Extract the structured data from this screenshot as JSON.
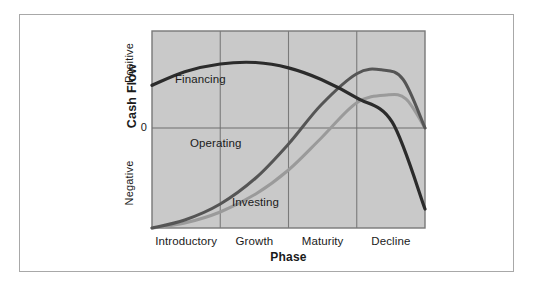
{
  "figure": {
    "border_color": "#a8a8a8",
    "background": "#ffffff"
  },
  "chart_data": {
    "type": "line",
    "title": "",
    "xlabel": "Phase",
    "ylabel": "Cash Flow",
    "categories": [
      "Introductory",
      "Growth",
      "Maturity",
      "Decline"
    ],
    "y_tick_labels": [
      "Positive",
      "0",
      "Negative"
    ],
    "ylim": [
      -1.0,
      1.0
    ],
    "grid": "vertical category dividers plus zero baseline",
    "legend": "inline labels on curves",
    "plot_background": "#c9c9c9",
    "plot_border_color": "#787878",
    "gridline_color": "#7a7a7a",
    "zero_line_color": "#6e6e6e",
    "series": [
      {
        "name": "Financing",
        "color": "#2b2b2b",
        "width": 3.2,
        "description": "Starts positive in Introductory, peaks early in Growth, declines steadily through Maturity and ends deeply negative in Decline.",
        "points": [
          [
            0.0,
            0.44
          ],
          [
            0.12,
            0.58
          ],
          [
            0.25,
            0.66
          ],
          [
            0.38,
            0.675
          ],
          [
            0.5,
            0.62
          ],
          [
            0.62,
            0.5
          ],
          [
            0.75,
            0.31
          ],
          [
            0.88,
            0.06
          ],
          [
            1.0,
            -0.81
          ]
        ]
      },
      {
        "name": "Operating",
        "color": "#555555",
        "width": 3.0,
        "description": "Starts deeply negative at launch, rises through Growth, crosses zero entering Maturity, peaks in Maturity then falls back to zero by end of Decline.",
        "points": [
          [
            0.0,
            -1.0
          ],
          [
            0.12,
            -0.92
          ],
          [
            0.25,
            -0.76
          ],
          [
            0.38,
            -0.5
          ],
          [
            0.5,
            -0.16
          ],
          [
            0.62,
            0.24
          ],
          [
            0.75,
            0.56
          ],
          [
            0.84,
            0.6
          ],
          [
            0.92,
            0.5
          ],
          [
            1.0,
            0.0
          ]
        ]
      },
      {
        "name": "Investing",
        "color": "#9a9a9a",
        "width": 3.0,
        "description": "Starts deeply negative, rises more slowly than Operating, crosses zero mid Maturity, peaks lower in Decline then returns to zero.",
        "points": [
          [
            0.0,
            -1.0
          ],
          [
            0.12,
            -0.95
          ],
          [
            0.25,
            -0.84
          ],
          [
            0.38,
            -0.66
          ],
          [
            0.5,
            -0.42
          ],
          [
            0.62,
            -0.1
          ],
          [
            0.75,
            0.26
          ],
          [
            0.86,
            0.34
          ],
          [
            0.93,
            0.3
          ],
          [
            1.0,
            0.0
          ]
        ]
      }
    ]
  },
  "labels": {
    "series_financing": "Financing",
    "series_operating": "Operating",
    "series_investing": "Investing",
    "y_positive": "Positive",
    "y_zero": "0",
    "y_negative": "Negative",
    "y_axis_title": "Cash Flow",
    "x_axis_title": "Phase",
    "x_cat_0": "Introductory",
    "x_cat_1": "Growth",
    "x_cat_2": "Maturity",
    "x_cat_3": "Decline"
  }
}
